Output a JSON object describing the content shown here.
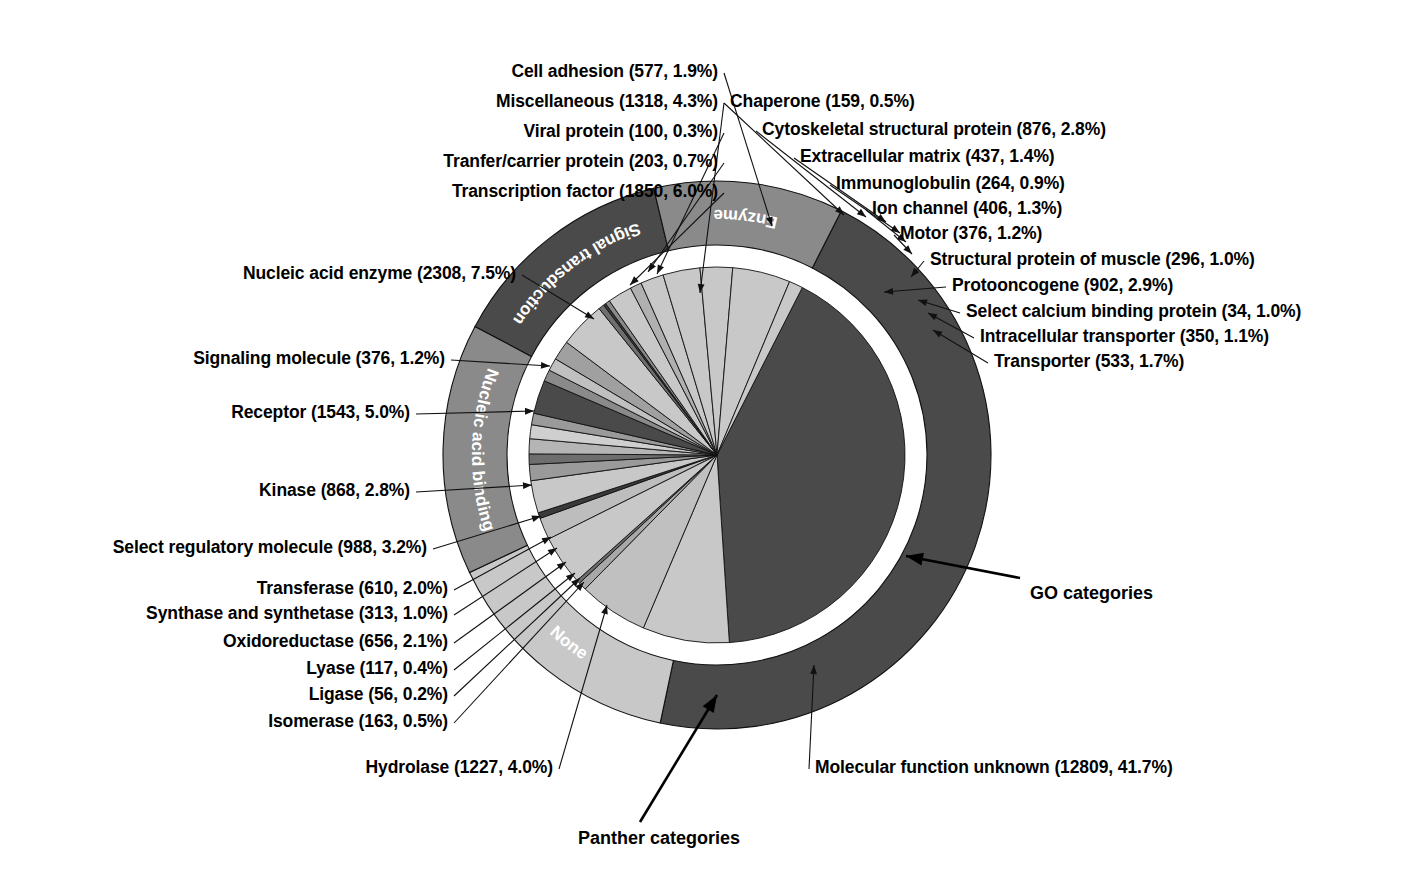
{
  "figure": {
    "center_x": 717,
    "center_y": 455,
    "r_inner_pie": 188,
    "r_ring_in": 210,
    "r_ring_out": 274,
    "colors": {
      "dark": "#4a4a4a",
      "mid": "#8a8a8a",
      "light": "#c8c8c8",
      "lighter": "#d8d8d8",
      "white": "#ffffff",
      "line": "#000000"
    }
  },
  "annotations": [
    {
      "name": "go-categories",
      "text": "GO categories",
      "x": 1030,
      "y": 583
    },
    {
      "name": "panther-categories",
      "text": "Panther categories",
      "x": 578,
      "y": 828
    }
  ],
  "chart_data": {
    "type": "pie",
    "title": "",
    "subtitle": "",
    "legend_position": "callout-labels",
    "total": 30718,
    "rings": [
      {
        "name": "GO categories (outer ring)",
        "radius_inner": 210,
        "radius_outer": 274,
        "segments": [
          {
            "label": "Molecular function unknown",
            "value": 12809,
            "percent": 41.7,
            "color": "#4a4a4a",
            "show_label": false
          },
          {
            "label": "None",
            "value": 4100,
            "percent": 13.3,
            "color": "#c8c8c8",
            "show_label": true
          },
          {
            "label": "Nucleic acid binding",
            "value": 4158,
            "percent": 13.5,
            "color": "#8a8a8a",
            "show_label": true
          },
          {
            "label": "Signal transduction",
            "value": 3775,
            "percent": 12.3,
            "color": "#4a4a4a",
            "show_label": true
          },
          {
            "label": "Enzyme",
            "value": 3142,
            "percent": 10.2,
            "color": "#8a8a8a",
            "show_label": true
          }
        ]
      },
      {
        "name": "Panther categories (inner pie)",
        "radius_inner": 0,
        "radius_outer": 188,
        "segments": [
          {
            "label": "Molecular function unknown",
            "value": 12809,
            "percent": 41.7,
            "color": "#4a4a4a"
          },
          {
            "label": "Nucleic acid enzyme",
            "value": 2308,
            "percent": 7.5,
            "color": "#c8c8c8"
          },
          {
            "label": "Transcription factor",
            "value": 1850,
            "percent": 6.0,
            "color": "#c0c0c0"
          },
          {
            "label": "Tranfer/carrier protein",
            "value": 203,
            "percent": 0.7,
            "color": "#a8a8a8"
          },
          {
            "label": "Viral protein",
            "value": 100,
            "percent": 0.3,
            "color": "#6e6e6e"
          },
          {
            "label": "Miscellaneous",
            "value": 1318,
            "percent": 4.3,
            "color": "#c8c8c8"
          },
          {
            "label": "Cell adhesion",
            "value": 577,
            "percent": 1.9,
            "color": "#bdbdbd"
          },
          {
            "label": "Chaperone",
            "value": 159,
            "percent": 0.5,
            "color": "#3a3a3a"
          },
          {
            "label": "Cytoskeletal structural protein",
            "value": 876,
            "percent": 2.8,
            "color": "#c8c8c8"
          },
          {
            "label": "Extracellular matrix",
            "value": 437,
            "percent": 1.4,
            "color": "#9a9a9a"
          },
          {
            "label": "Immunoglobulin",
            "value": 264,
            "percent": 0.9,
            "color": "#6e6e6e"
          },
          {
            "label": "Ion channel",
            "value": 406,
            "percent": 1.3,
            "color": "#b5b5b5"
          },
          {
            "label": "Motor",
            "value": 376,
            "percent": 1.2,
            "color": "#cfcfcf"
          },
          {
            "label": "Structural protein of muscle",
            "value": 296,
            "percent": 1.0,
            "color": "#9a9a9a"
          },
          {
            "label": "Protooncogene",
            "value": 902,
            "percent": 2.9,
            "color": "#4a4a4a"
          },
          {
            "label": "Select calcium binding protein",
            "value": 34,
            "percent": 1.0,
            "color": "#8a8a8a"
          },
          {
            "label": "Intracellular transporter",
            "value": 350,
            "percent": 1.1,
            "color": "#c0c0c0"
          },
          {
            "label": "Transporter",
            "value": 533,
            "percent": 1.7,
            "color": "#a0a0a0"
          },
          {
            "label": "Hydrolase",
            "value": 1227,
            "percent": 4.0,
            "color": "#c8c8c8"
          },
          {
            "label": "Isomerase",
            "value": 163,
            "percent": 0.5,
            "color": "#6e6e6e"
          },
          {
            "label": "Ligase",
            "value": 56,
            "percent": 0.2,
            "color": "#3a3a3a"
          },
          {
            "label": "Lyase",
            "value": 117,
            "percent": 0.4,
            "color": "#8a8a8a"
          },
          {
            "label": "Oxidoreductase",
            "value": 656,
            "percent": 2.1,
            "color": "#c8c8c8"
          },
          {
            "label": "Synthase and synthetase",
            "value": 313,
            "percent": 1.0,
            "color": "#b0b0b0"
          },
          {
            "label": "Transferase",
            "value": 610,
            "percent": 2.0,
            "color": "#c8c8c8"
          },
          {
            "label": "Select regulatory molecule",
            "value": 988,
            "percent": 3.2,
            "color": "#c8c8c8"
          },
          {
            "label": "Kinase",
            "value": 868,
            "percent": 2.8,
            "color": "#c8c8c8"
          },
          {
            "label": "Receptor",
            "value": 1543,
            "percent": 5.0,
            "color": "#c8c8c8"
          },
          {
            "label": "Signaling molecule",
            "value": 376,
            "percent": 1.2,
            "color": "#c8c8c8"
          }
        ]
      }
    ],
    "callouts": [
      {
        "key": "cell_adhesion",
        "text": "Cell adhesion (577, 1.9%)",
        "x": 718,
        "y": 62,
        "align": "right",
        "tx": 772,
        "ty": 226
      },
      {
        "key": "miscellaneous",
        "text": "Miscellaneous (1318, 4.3%)",
        "x": 718,
        "y": 92,
        "align": "right",
        "tx": 700,
        "ty": 293
      },
      {
        "key": "viral_protein",
        "text": "Viral protein (100, 0.3%)",
        "x": 718,
        "y": 122,
        "align": "right",
        "tx": 657,
        "ty": 274
      },
      {
        "key": "tranfer_carrier",
        "text": "Tranfer/carrier protein (203, 0.7%)",
        "x": 718,
        "y": 152,
        "align": "right",
        "tx": 648,
        "ty": 272
      },
      {
        "key": "transcription_factor",
        "text": "Transcription factor (1850, 6.0%)",
        "x": 718,
        "y": 182,
        "align": "right",
        "tx": 630,
        "ty": 285
      },
      {
        "key": "nucleic_acid_enzyme",
        "text": "Nucleic acid enzyme (2308, 7.5%)",
        "x": 516,
        "y": 264,
        "align": "right",
        "tx": 594,
        "ty": 319
      },
      {
        "key": "signaling_molecule",
        "text": "Signaling molecule (376, 1.2%)",
        "x": 445,
        "y": 349,
        "align": "right",
        "tx": 550,
        "ty": 366
      },
      {
        "key": "receptor",
        "text": "Receptor (1543, 5.0%)",
        "x": 410,
        "y": 403,
        "align": "right",
        "tx": 534,
        "ty": 411
      },
      {
        "key": "kinase",
        "text": "Kinase (868, 2.8%)",
        "x": 410,
        "y": 481,
        "align": "right",
        "tx": 532,
        "ty": 485
      },
      {
        "key": "select_regulatory",
        "text": "Select regulatory molecule (988, 3.2%)",
        "x": 427,
        "y": 538,
        "align": "right",
        "tx": 541,
        "ty": 516
      },
      {
        "key": "transferase",
        "text": "Transferase (610, 2.0%)",
        "x": 448,
        "y": 579,
        "align": "right",
        "tx": 551,
        "ty": 537
      },
      {
        "key": "synthase",
        "text": "Synthase and synthetase (313, 1.0%)",
        "x": 448,
        "y": 604,
        "align": "right",
        "tx": 557,
        "ty": 548
      },
      {
        "key": "oxidoreductase",
        "text": "Oxidoreductase (656, 2.1%)",
        "x": 448,
        "y": 632,
        "align": "right",
        "tx": 566,
        "ty": 562
      },
      {
        "key": "lyase",
        "text": "Lyase (117, 0.4%)",
        "x": 448,
        "y": 659,
        "align": "right",
        "tx": 575,
        "ty": 573
      },
      {
        "key": "ligase",
        "text": "Ligase (56, 0.2%)",
        "x": 448,
        "y": 685,
        "align": "right",
        "tx": 580,
        "ty": 578
      },
      {
        "key": "isomerase",
        "text": "Isomerase (163, 0.5%)",
        "x": 448,
        "y": 712,
        "align": "right",
        "tx": 584,
        "ty": 582
      },
      {
        "key": "hydrolase",
        "text": "Hydrolase (1227, 4.0%)",
        "x": 553,
        "y": 758,
        "align": "right",
        "tx": 607,
        "ty": 605
      },
      {
        "key": "chaperone",
        "text": "Chaperone (159, 0.5%)",
        "x": 730,
        "y": 92,
        "align": "left",
        "tx": 844,
        "ty": 215
      },
      {
        "key": "cytoskeletal",
        "text": "Cytoskeletal structural protein (876, 2.8%)",
        "x": 762,
        "y": 120,
        "align": "left",
        "tx": 866,
        "ty": 217
      },
      {
        "key": "extracellular_matrix",
        "text": "Extracellular matrix (437, 1.4%)",
        "x": 800,
        "y": 147,
        "align": "left",
        "tx": 886,
        "ty": 222
      },
      {
        "key": "immunoglobulin",
        "text": "Immunoglobulin (264, 0.9%)",
        "x": 836,
        "y": 174,
        "align": "left",
        "tx": 900,
        "ty": 233
      },
      {
        "key": "ion_channel",
        "text": "Ion channel (406, 1.3%)",
        "x": 872,
        "y": 199,
        "align": "left",
        "tx": 906,
        "ty": 242
      },
      {
        "key": "motor",
        "text": "Motor (376, 1.2%)",
        "x": 900,
        "y": 224,
        "align": "left",
        "tx": 912,
        "ty": 254
      },
      {
        "key": "struct_muscle",
        "text": "Structural protein of muscle (296, 1.0%)",
        "x": 930,
        "y": 250,
        "align": "left",
        "tx": 911,
        "ty": 277
      },
      {
        "key": "protooncogene",
        "text": "Protooncogene (902, 2.9%)",
        "x": 952,
        "y": 276,
        "align": "left",
        "tx": 884,
        "ty": 292
      },
      {
        "key": "select_calcium",
        "text": "Select calcium binding protein (34, 1.0%)",
        "x": 966,
        "y": 302,
        "align": "left",
        "tx": 918,
        "ty": 300
      },
      {
        "key": "intracellular_tr",
        "text": "Intracellular transporter (350, 1.1%)",
        "x": 980,
        "y": 327,
        "align": "left",
        "tx": 928,
        "ty": 313
      },
      {
        "key": "transporter",
        "text": "Transporter (533, 1.7%)",
        "x": 994,
        "y": 352,
        "align": "left",
        "tx": 933,
        "ty": 330
      },
      {
        "key": "mol_func_unknown",
        "text": "Molecular function unknown (12809, 41.7%)",
        "x": 815,
        "y": 758,
        "align": "left",
        "tx": 814,
        "ty": 665
      }
    ]
  }
}
